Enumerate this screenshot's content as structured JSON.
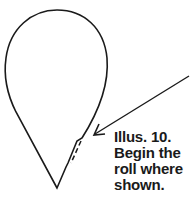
{
  "caption": {
    "lines": [
      "Illus. 10.",
      "Begin the",
      "roll where",
      "shown."
    ]
  },
  "colors": {
    "stroke": "#1a1a1a",
    "background": "#ffffff"
  },
  "figure": {
    "shape": "teardrop-outline",
    "feature": "notch-with-dashed-roll-line",
    "arrow": "pointer-to-roll-start"
  }
}
